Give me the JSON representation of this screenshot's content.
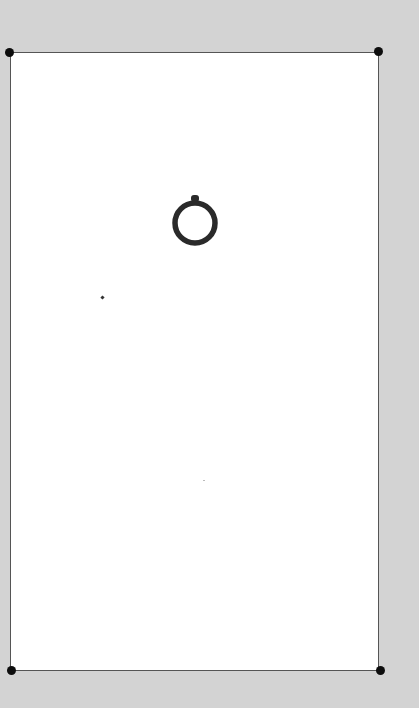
{
  "page": {
    "background_color": "#d3d3d3",
    "card_color": "#ffffff",
    "frame_line_color": "#555555",
    "corner_dot_color": "#0d0d0d"
  },
  "card": {
    "corners": [
      "top-left",
      "top-right",
      "bottom-left",
      "bottom-right"
    ],
    "glyph": {
      "name": "ring-icon",
      "color": "#2a2a2a"
    }
  }
}
